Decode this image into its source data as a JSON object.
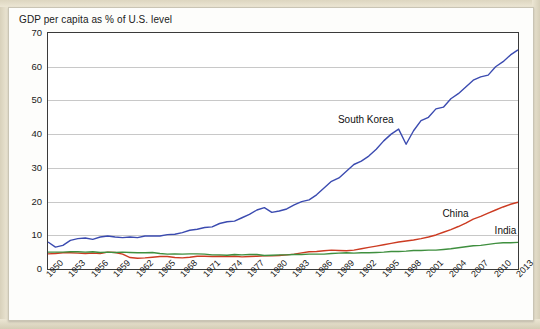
{
  "chart_data": {
    "type": "line",
    "title": "GDP per capita as % of U.S. level",
    "xlabel": "",
    "ylabel": "",
    "ylim": [
      0,
      70
    ],
    "yticks": [
      0,
      10,
      20,
      30,
      40,
      50,
      60,
      70
    ],
    "grid": true,
    "legend_position": "inline-annotations",
    "xlim": [
      1950,
      2013
    ],
    "xticks": [
      "1950",
      "1953",
      "1956",
      "1959",
      "1962",
      "1965",
      "1968",
      "1971",
      "1974",
      "1977",
      "1980",
      "1983",
      "1986",
      "1989",
      "1992",
      "1995",
      "1998",
      "2001",
      "2004",
      "2007",
      "2010",
      "2013"
    ],
    "annotations": [
      {
        "text": "South Korea",
        "x": 1989,
        "y": 44
      },
      {
        "text": "China",
        "x": 2003,
        "y": 16
      },
      {
        "text": "India",
        "x": 2010,
        "y": 11
      }
    ],
    "series": [
      {
        "name": "South Korea",
        "color": "#3b4bb0",
        "x": [
          1950,
          1951,
          1952,
          1953,
          1954,
          1955,
          1956,
          1957,
          1958,
          1959,
          1960,
          1961,
          1962,
          1963,
          1964,
          1965,
          1966,
          1967,
          1968,
          1969,
          1970,
          1971,
          1972,
          1973,
          1974,
          1975,
          1976,
          1977,
          1978,
          1979,
          1980,
          1981,
          1982,
          1983,
          1984,
          1985,
          1986,
          1987,
          1988,
          1989,
          1990,
          1991,
          1992,
          1993,
          1994,
          1995,
          1996,
          1997,
          1998,
          1999,
          2000,
          2001,
          2002,
          2003,
          2004,
          2005,
          2006,
          2007,
          2008,
          2009,
          2010,
          2011,
          2012,
          2013
        ],
        "values": [
          8.0,
          6.5,
          7.0,
          8.5,
          9.0,
          9.2,
          8.8,
          9.5,
          9.8,
          9.5,
          9.3,
          9.5,
          9.3,
          9.8,
          9.8,
          9.8,
          10.2,
          10.3,
          10.8,
          11.5,
          11.8,
          12.3,
          12.5,
          13.5,
          14.0,
          14.2,
          15.2,
          16.2,
          17.5,
          18.2,
          16.8,
          17.2,
          17.8,
          19.0,
          20.0,
          20.5,
          22.0,
          24.0,
          26.0,
          27.0,
          29.0,
          31.0,
          32.0,
          33.5,
          35.5,
          38.0,
          40.0,
          41.5,
          37.0,
          41.0,
          44.0,
          45.0,
          47.5,
          48.0,
          50.5,
          52.0,
          54.0,
          56.0,
          57.0,
          57.5,
          60.0,
          61.5,
          63.5,
          65.0
        ]
      },
      {
        "name": "China",
        "color": "#cc3b22",
        "x": [
          1950,
          1951,
          1952,
          1953,
          1954,
          1955,
          1956,
          1957,
          1958,
          1959,
          1960,
          1961,
          1962,
          1963,
          1964,
          1965,
          1966,
          1967,
          1968,
          1969,
          1970,
          1971,
          1972,
          1973,
          1974,
          1975,
          1976,
          1977,
          1978,
          1979,
          1980,
          1981,
          1982,
          1983,
          1984,
          1985,
          1986,
          1987,
          1988,
          1989,
          1990,
          1991,
          1992,
          1993,
          1994,
          1995,
          1996,
          1997,
          1998,
          1999,
          2000,
          2001,
          2002,
          2003,
          2004,
          2005,
          2006,
          2007,
          2008,
          2009,
          2010,
          2011,
          2012,
          2013
        ],
        "values": [
          4.5,
          4.6,
          4.8,
          4.8,
          4.7,
          4.6,
          4.7,
          4.6,
          5.0,
          4.9,
          4.4,
          3.4,
          3.2,
          3.3,
          3.5,
          3.7,
          3.7,
          3.4,
          3.3,
          3.5,
          3.8,
          3.8,
          3.7,
          3.8,
          3.7,
          3.8,
          3.6,
          3.7,
          3.8,
          3.9,
          3.9,
          4.0,
          4.2,
          4.4,
          4.8,
          5.1,
          5.2,
          5.4,
          5.6,
          5.5,
          5.4,
          5.6,
          6.0,
          6.4,
          6.8,
          7.2,
          7.6,
          8.0,
          8.3,
          8.6,
          9.0,
          9.5,
          10.1,
          10.9,
          11.7,
          12.6,
          13.6,
          14.8,
          15.6,
          16.6,
          17.5,
          18.4,
          19.2,
          19.8
        ]
      },
      {
        "name": "India",
        "color": "#3f8f3f",
        "x": [
          1950,
          1951,
          1952,
          1953,
          1954,
          1955,
          1956,
          1957,
          1958,
          1959,
          1960,
          1961,
          1962,
          1963,
          1964,
          1965,
          1966,
          1967,
          1968,
          1969,
          1970,
          1971,
          1972,
          1973,
          1974,
          1975,
          1976,
          1977,
          1978,
          1979,
          1980,
          1981,
          1982,
          1983,
          1984,
          1985,
          1986,
          1987,
          1988,
          1989,
          1990,
          1991,
          1992,
          1993,
          1994,
          1995,
          1996,
          1997,
          1998,
          1999,
          2000,
          2001,
          2002,
          2003,
          2004,
          2005,
          2006,
          2007,
          2008,
          2009,
          2010,
          2011,
          2012,
          2013
        ],
        "values": [
          5.0,
          5.0,
          5.0,
          5.1,
          5.1,
          5.0,
          5.1,
          4.9,
          5.0,
          4.9,
          5.0,
          4.9,
          4.8,
          4.8,
          4.9,
          4.6,
          4.4,
          4.5,
          4.4,
          4.5,
          4.5,
          4.4,
          4.2,
          4.2,
          4.1,
          4.3,
          4.2,
          4.3,
          4.3,
          4.0,
          4.1,
          4.2,
          4.2,
          4.3,
          4.3,
          4.4,
          4.4,
          4.4,
          4.6,
          4.7,
          4.8,
          4.7,
          4.8,
          4.8,
          4.9,
          5.0,
          5.2,
          5.2,
          5.3,
          5.5,
          5.5,
          5.6,
          5.6,
          5.8,
          6.0,
          6.3,
          6.6,
          6.9,
          7.0,
          7.3,
          7.6,
          7.8,
          7.8,
          7.9
        ]
      }
    ]
  }
}
